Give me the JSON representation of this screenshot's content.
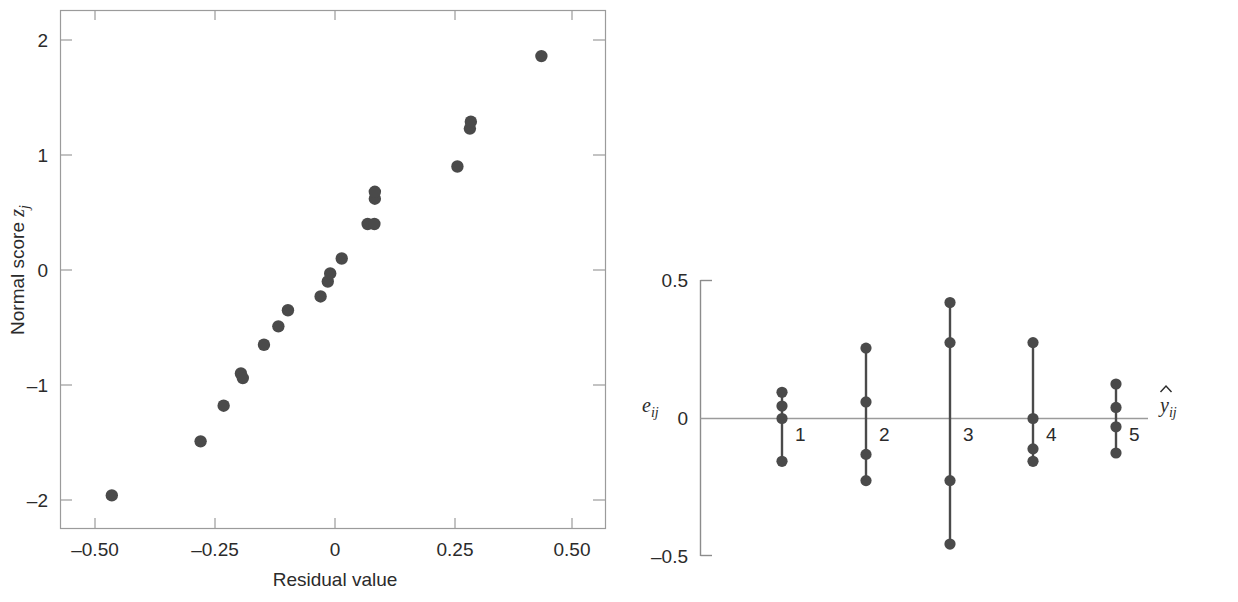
{
  "figure": {
    "title": "",
    "background_color": "#ffffff",
    "marker_color": "#4a4a4a",
    "axis_color": "#9b9b9b"
  },
  "chart_data": [
    {
      "type": "scatter",
      "panel": "left",
      "title": "",
      "xlabel": "Residual value",
      "ylabel": "Normal score zⱼ",
      "ylabel_base": "Normal score",
      "ylabel_math": "z",
      "ylabel_math_sub": "j",
      "xlim": [
        -0.57,
        0.54
      ],
      "ylim": [
        -2.3,
        2.3
      ],
      "grid": false,
      "legend": "none",
      "xticks": [
        -0.5,
        -0.25,
        0,
        0.25,
        0.5
      ],
      "xticklabels": [
        "–0.50",
        "–0.25",
        "0",
        "0.25",
        "0.50"
      ],
      "yticks": [
        2,
        1,
        0,
        -1,
        -2
      ],
      "yticklabels": [
        "2",
        "1",
        "0",
        "–1",
        "–2"
      ],
      "x": [
        -0.465,
        -0.28,
        -0.232,
        -0.196,
        -0.192,
        -0.148,
        -0.118,
        -0.098,
        -0.03,
        -0.015,
        -0.01,
        0.014,
        0.068,
        0.082,
        0.083,
        0.083,
        0.255,
        0.281,
        0.283,
        0.43
      ],
      "y": [
        -1.96,
        -1.49,
        -1.18,
        -0.9,
        -0.94,
        -0.65,
        -0.49,
        -0.35,
        -0.23,
        -0.1,
        -0.03,
        0.1,
        0.4,
        0.4,
        0.62,
        0.68,
        0.9,
        1.23,
        1.29,
        1.86
      ],
      "n_points": 20
    },
    {
      "type": "scatter",
      "panel": "right",
      "title": "",
      "xlabel": "ŷᵢⱼ",
      "xlabel_math": "y",
      "xlabel_math_sub": "ij",
      "ylabel": "eᵢⱼ",
      "ylabel_math": "e",
      "ylabel_math_sub": "ij",
      "ylim": [
        -0.5,
        0.5
      ],
      "yticks": [
        0.5,
        0,
        -0.5
      ],
      "yticklabels": [
        "0.5",
        "0",
        "–0.5"
      ],
      "grid": false,
      "legend": "none",
      "categories": [
        "1",
        "2",
        "3",
        "4",
        "5"
      ],
      "groups": [
        {
          "label": "1",
          "values": [
            0.095,
            0.045,
            0.0,
            -0.155
          ]
        },
        {
          "label": "2",
          "values": [
            0.255,
            0.06,
            -0.13,
            -0.225
          ]
        },
        {
          "label": "3",
          "values": [
            0.42,
            0.275,
            -0.225,
            -0.455
          ]
        },
        {
          "label": "4",
          "values": [
            0.275,
            0.0,
            -0.11,
            -0.155
          ]
        },
        {
          "label": "5",
          "values": [
            0.125,
            0.04,
            -0.03,
            -0.125
          ]
        }
      ]
    }
  ]
}
